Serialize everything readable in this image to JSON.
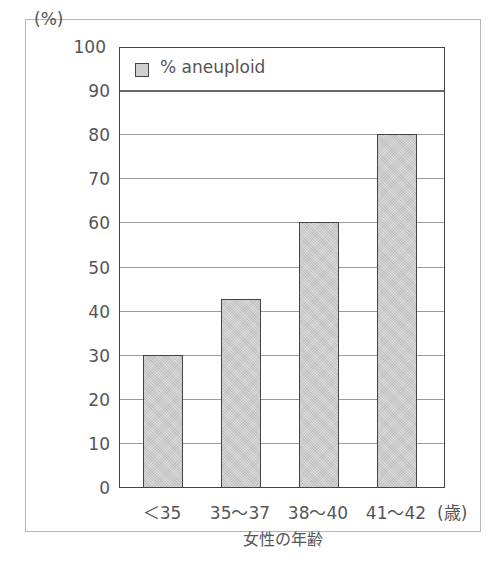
{
  "chart_data": {
    "type": "bar",
    "title": "",
    "categories": [
      "<35",
      "35~37",
      "38~40",
      "41~42"
    ],
    "series": [
      {
        "name": "% aneuploid",
        "values": [
          30,
          42.7,
          60,
          80
        ]
      }
    ],
    "xlabel": "女性の年齢",
    "xunit": "(歳)",
    "ylabel": "(%)",
    "ylim": [
      0,
      100
    ],
    "yticks": [
      0,
      10,
      20,
      30,
      40,
      50,
      60,
      70,
      80,
      90,
      100
    ],
    "grid": true,
    "legend_position": "top-inside",
    "bar_color": "#cfcfcf",
    "bar_border_color": "#444444"
  },
  "labels": {
    "y_unit": "(%)",
    "x_unit": "(歳)",
    "x_title": "女性の年齢",
    "legend": "% aneuploid",
    "ticks_y": [
      "0",
      "10",
      "20",
      "30",
      "40",
      "50",
      "60",
      "70",
      "80",
      "90",
      "100"
    ],
    "ticks_x": [
      "<35",
      "35~37",
      "38~40",
      "41~42"
    ]
  }
}
